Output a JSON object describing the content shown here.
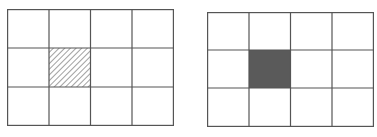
{
  "figure": {
    "panels": [
      {
        "id": "left",
        "rows": 3,
        "cols": 4,
        "highlight": {
          "row": 1,
          "col": 1,
          "style": "hatched"
        },
        "line_color": "#555555",
        "hatch_color": "#444444"
      },
      {
        "id": "right",
        "rows": 3,
        "cols": 4,
        "highlight": {
          "row": 1,
          "col": 1,
          "style": "filled"
        },
        "line_color": "#555555",
        "fill_color": "#5a5a5a"
      }
    ]
  }
}
